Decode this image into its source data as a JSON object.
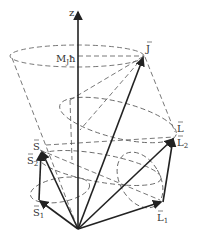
{
  "diagram": {
    "type": "vector-model-angular-momentum-coupling",
    "labels": {
      "z_axis": "z",
      "projection": "M",
      "projection_sub": "J",
      "hbar": "ħ",
      "J": "J",
      "L": "L",
      "L2": "L",
      "L2_sub": "2",
      "L1": "L",
      "L1_sub": "1",
      "S": "S",
      "S2": "S",
      "S2_sub": "2",
      "S1": "S",
      "S1_sub": "1"
    },
    "colors": {
      "background": "#ffffff",
      "ink": "#222222",
      "dashed": "#555555"
    }
  }
}
